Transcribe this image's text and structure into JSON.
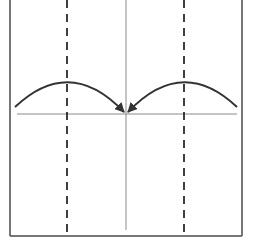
{
  "diagram": {
    "type": "origami-fold-step",
    "paper": {
      "left": 10,
      "right": 242,
      "top": 0,
      "bottom": 236,
      "stroke": "#4a4a4a"
    },
    "center_crease": {
      "x": 126,
      "y1": 0,
      "y2": 230,
      "stroke": "#8a8a8a"
    },
    "horizontal_crease": {
      "y": 114,
      "x1": 17,
      "x2": 237,
      "stroke": "#8a8a8a"
    },
    "valley_folds": [
      {
        "name": "left-valley-fold",
        "x": 67,
        "y1": 0,
        "y2": 232
      },
      {
        "name": "right-valley-fold",
        "x": 184,
        "y1": 0,
        "y2": 232
      }
    ],
    "dash_color": "#2a2a2a",
    "arrows": [
      {
        "name": "left-fold-arrow",
        "start": [
          15,
          107
        ],
        "control": [
          70,
          55
        ],
        "end": [
          124,
          112
        ]
      },
      {
        "name": "right-fold-arrow",
        "start": [
          237,
          107
        ],
        "control": [
          182,
          55
        ],
        "end": [
          128,
          112
        ]
      }
    ],
    "arrow_color": "#333333"
  }
}
